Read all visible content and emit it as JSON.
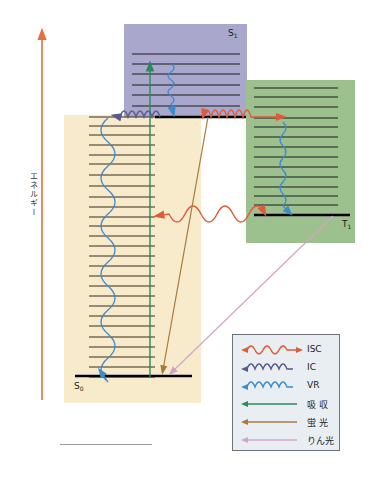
{
  "axis": {
    "energy_label": "エネルギー",
    "arrow_color": "#e8703a"
  },
  "states": {
    "s1": {
      "label": "S",
      "sub": "1",
      "color": "#a9a8cc"
    },
    "s0": {
      "label": "S",
      "sub": "0",
      "color": "#f7ebcc"
    },
    "t1": {
      "label": "T",
      "sub": "1",
      "color": "#9dc08f"
    }
  },
  "legend": {
    "items": [
      {
        "label": "ISC",
        "type": "wave-double",
        "color": "#e05a3a"
      },
      {
        "label": "IC",
        "type": "wave",
        "color": "#5a5a8e"
      },
      {
        "label": "VR",
        "type": "wave",
        "color": "#3a8ccd"
      },
      {
        "label": "吸 収",
        "type": "arrow",
        "color": "#2a8a5a"
      },
      {
        "label": "蛍 光",
        "type": "arrow",
        "color": "#a87a3a"
      },
      {
        "label": "りん光",
        "type": "arrow",
        "color": "#d4a3c8"
      }
    ]
  }
}
